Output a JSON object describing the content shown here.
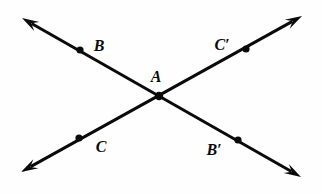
{
  "figure": {
    "type": "geometry-diagram",
    "width": 322,
    "height": 194,
    "background_color": "#fefefe",
    "stroke_color": "#0a0a0a",
    "label_color": "#0a0a0a",
    "line_width": 3,
    "dot_radius": 3.6,
    "vertex_dot_radius": 4.2
  },
  "points": [
    {
      "id": "A",
      "label": "A",
      "role": "intersection-vertex",
      "x": 159,
      "y": 96,
      "label_x": 156,
      "label_y": 77,
      "dot": true
    },
    {
      "id": "B",
      "label": "B",
      "role": "point-on-line-1",
      "x": 80,
      "y": 50,
      "label_x": 99,
      "label_y": 46,
      "dot": true
    },
    {
      "id": "Bprime",
      "label": "B′",
      "role": "point-on-line-1",
      "x": 238,
      "y": 140,
      "label_x": 214,
      "label_y": 150,
      "dot": true
    },
    {
      "id": "C",
      "label": "C",
      "role": "point-on-line-2",
      "x": 79,
      "y": 138,
      "label_x": 101,
      "label_y": 147,
      "dot": true
    },
    {
      "id": "Cprime",
      "label": "C′",
      "role": "point-on-line-2",
      "x": 246,
      "y": 49,
      "label_x": 222,
      "label_y": 45,
      "dot": true
    }
  ],
  "lines": [
    {
      "id": "line-B-Bprime",
      "name": "line through B, A and B-prime",
      "from_x": 22,
      "from_y": 18,
      "to_x": 301,
      "to_y": 177,
      "arrow_start": true,
      "arrow_end": true,
      "passes_through": [
        "B",
        "A",
        "B′"
      ]
    },
    {
      "id": "line-C-Cprime",
      "name": "line through C, A and C-prime",
      "from_x": 21,
      "from_y": 172,
      "to_x": 302,
      "to_y": 16,
      "arrow_start": true,
      "arrow_end": true,
      "passes_through": [
        "C",
        "A",
        "C′"
      ]
    }
  ]
}
